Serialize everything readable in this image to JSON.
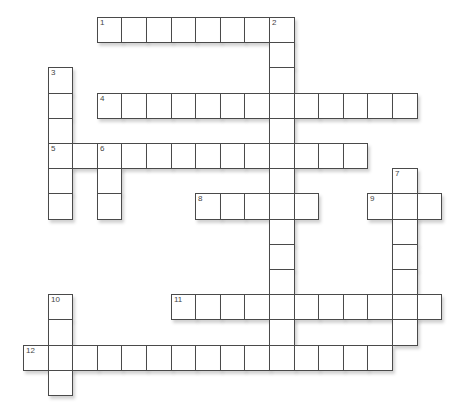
{
  "puzzle": {
    "grid": {
      "origin_x": 23,
      "origin_y": 17,
      "cell_w": 24.6,
      "cell_h": 25.2
    },
    "colors": {
      "border": "#4a4a4a",
      "number": "#444444",
      "background": "#ffffff"
    },
    "words": [
      {
        "number": "1",
        "direction": "across",
        "row": 0,
        "col": 3,
        "length": 8
      },
      {
        "number": "2",
        "direction": "down",
        "row": 0,
        "col": 10,
        "length": 14
      },
      {
        "number": "3",
        "direction": "down",
        "row": 2,
        "col": 1,
        "length": 6
      },
      {
        "number": "4",
        "direction": "across",
        "row": 3,
        "col": 3,
        "length": 13
      },
      {
        "number": "5",
        "direction": "across",
        "row": 5,
        "col": 1,
        "length": 13
      },
      {
        "number": "6",
        "direction": "down",
        "row": 5,
        "col": 3,
        "length": 3
      },
      {
        "number": "7",
        "direction": "down",
        "row": 6,
        "col": 15,
        "length": 7
      },
      {
        "number": "8",
        "direction": "across",
        "row": 7,
        "col": 7,
        "length": 5
      },
      {
        "number": "9",
        "direction": "across",
        "row": 7,
        "col": 14,
        "length": 3
      },
      {
        "number": "10",
        "direction": "down",
        "row": 11,
        "col": 1,
        "length": 4
      },
      {
        "number": "11",
        "direction": "across",
        "row": 11,
        "col": 6,
        "length": 11
      },
      {
        "number": "12",
        "direction": "across",
        "row": 13,
        "col": 0,
        "length": 15
      }
    ]
  }
}
